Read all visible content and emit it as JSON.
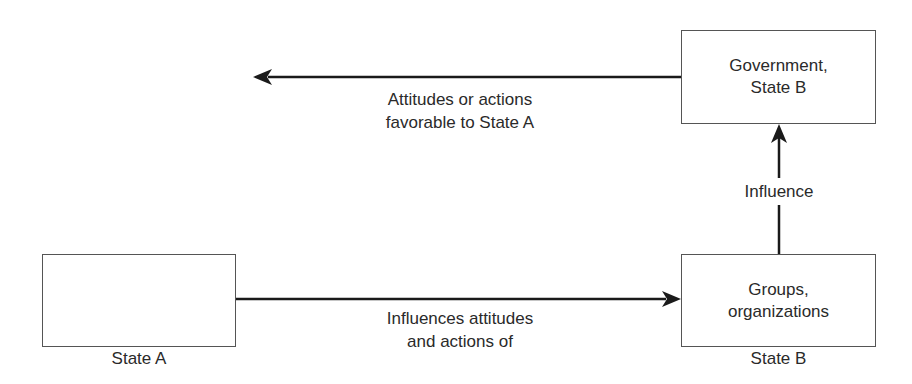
{
  "diagram": {
    "type": "influence-flow",
    "nodes": {
      "state_a_box": {
        "lines": [],
        "caption": "State A"
      },
      "groups_box": {
        "lines": [
          "Groups,",
          "organizations"
        ],
        "caption": "State B"
      },
      "government_box": {
        "lines": [
          "Government,",
          "State B"
        ],
        "caption": ""
      }
    },
    "edges": {
      "state_a_to_groups": {
        "from": "State A",
        "to": "Groups, organizations",
        "label_lines": [
          "Influences attitudes",
          "and actions of"
        ]
      },
      "groups_to_government": {
        "from": "Groups, organizations",
        "to": "Government, State B",
        "label_lines": [
          "Influence"
        ]
      },
      "government_to_state_a": {
        "from": "Government, State B",
        "to": "State A",
        "label_lines": [
          "Attitudes or actions",
          "favorable to State A"
        ]
      }
    },
    "colors": {
      "line": "#1a1a1a",
      "box_border": "#555555",
      "text": "#2a2a2a",
      "background": "#ffffff"
    }
  }
}
